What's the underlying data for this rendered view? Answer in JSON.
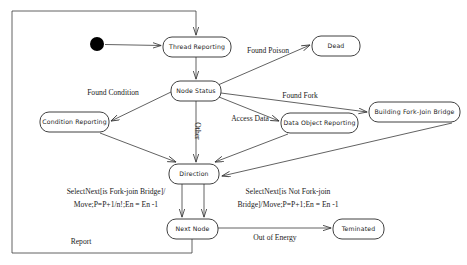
{
  "diagram": {
    "type": "uml-state-machine",
    "colors": {
      "background": "#ffffff",
      "stroke": "#3a3a3a",
      "box_stroke": "#2b2b2b",
      "text": "#1a1a1a",
      "initial_dot": "#000000"
    },
    "initial_state": {
      "name": "initial-pseudostate",
      "cx": 97,
      "cy": 44,
      "r": 7
    },
    "states": [
      {
        "id": "thread-reporting",
        "label": "Thread Reporting",
        "x": 163,
        "y": 37,
        "w": 68,
        "h": 20
      },
      {
        "id": "dead",
        "label": "Dead",
        "x": 312,
        "y": 36,
        "w": 48,
        "h": 20
      },
      {
        "id": "node-status",
        "label": "Node Status",
        "x": 171,
        "y": 81,
        "w": 50,
        "h": 20
      },
      {
        "id": "condition-reporting",
        "label": "Condition Reporting",
        "x": 40,
        "y": 112,
        "w": 69,
        "h": 20
      },
      {
        "id": "data-object-reporting",
        "label": "Data Object Reporting",
        "x": 281,
        "y": 113,
        "w": 77,
        "h": 20
      },
      {
        "id": "building-fork-join-bridge",
        "label": "Building Fork-Join Bridge",
        "x": 369,
        "y": 102,
        "w": 91,
        "h": 20
      },
      {
        "id": "direction",
        "label": "Direction",
        "x": 169,
        "y": 164,
        "w": 50,
        "h": 20
      },
      {
        "id": "next-node",
        "label": "Next Node",
        "x": 167,
        "y": 219,
        "w": 51,
        "h": 20
      },
      {
        "id": "teminated",
        "label": "Teminated",
        "x": 333,
        "y": 219,
        "w": 51,
        "h": 20
      }
    ],
    "edge_labels": [
      {
        "id": "found-poison",
        "text": "Found Poison",
        "x": 268,
        "y": 51,
        "rotate": 0
      },
      {
        "id": "found-condition",
        "text": "Found Condition",
        "x": 113,
        "y": 93,
        "rotate": 0
      },
      {
        "id": "found-fork",
        "text": "Found Fork",
        "x": 300,
        "y": 96,
        "rotate": 0
      },
      {
        "id": "access-data",
        "text": "Access Data",
        "x": 250,
        "y": 119,
        "rotate": 0
      },
      {
        "id": "other",
        "text": "Other",
        "x": 197,
        "y": 131,
        "rotate": 90
      },
      {
        "id": "select-next-fork-line1",
        "text": "SelectNext[is Fork-join Bridge]/",
        "x": 116,
        "y": 192,
        "rotate": 0
      },
      {
        "id": "select-next-fork-line2",
        "text": "Move;P=P+1/n!;En = En -1",
        "x": 116,
        "y": 205,
        "rotate": 0
      },
      {
        "id": "select-next-notfork-line1",
        "text": "SelectNext[is Not Fork-join",
        "x": 288,
        "y": 192,
        "rotate": 0
      },
      {
        "id": "select-next-notfork-line2",
        "text": "Bridge]/Move;P=P+1;En = En -1",
        "x": 288,
        "y": 205,
        "rotate": 0
      },
      {
        "id": "out-of-energy",
        "text": "Out of Energy",
        "x": 275,
        "y": 238,
        "rotate": 0
      },
      {
        "id": "report",
        "text": "Report",
        "x": 81,
        "y": 242,
        "rotate": 0
      }
    ],
    "transitions": [
      {
        "id": "init-to-thread-reporting",
        "from": "initial-pseudostate",
        "to": "thread-reporting",
        "label": ""
      },
      {
        "id": "thread-reporting-to-node-status",
        "from": "thread-reporting",
        "to": "node-status",
        "label": ""
      },
      {
        "id": "node-status-to-dead",
        "from": "node-status",
        "to": "dead",
        "label": "Found Poison"
      },
      {
        "id": "node-status-to-condition-reporting",
        "from": "node-status",
        "to": "condition-reporting",
        "label": "Found Condition"
      },
      {
        "id": "node-status-to-building-fork-join-bridge",
        "from": "node-status",
        "to": "building-fork-join-bridge",
        "label": "Found Fork"
      },
      {
        "id": "node-status-to-data-object-reporting",
        "from": "node-status",
        "to": "data-object-reporting",
        "label": "Access Data"
      },
      {
        "id": "node-status-to-direction",
        "from": "node-status",
        "to": "direction",
        "label": "Other"
      },
      {
        "id": "condition-reporting-to-direction",
        "from": "condition-reporting",
        "to": "direction",
        "label": ""
      },
      {
        "id": "data-object-reporting-to-direction",
        "from": "data-object-reporting",
        "to": "direction",
        "label": ""
      },
      {
        "id": "building-fork-join-bridge-to-direction",
        "from": "building-fork-join-bridge",
        "to": "direction",
        "label": ""
      },
      {
        "id": "direction-to-next-node-fork",
        "from": "direction",
        "to": "next-node",
        "label": "SelectNext[is Fork-join Bridge]/Move;P=P+1/n!;En = En -1"
      },
      {
        "id": "direction-to-next-node-notfork",
        "from": "direction",
        "to": "next-node",
        "label": "SelectNext[is Not Fork-join Bridge]/Move;P=P+1;En = En -1"
      },
      {
        "id": "next-node-to-teminated",
        "from": "next-node",
        "to": "teminated",
        "label": "Out of Energy"
      },
      {
        "id": "next-node-to-thread-reporting",
        "from": "next-node",
        "to": "thread-reporting",
        "label": "Report"
      }
    ]
  }
}
